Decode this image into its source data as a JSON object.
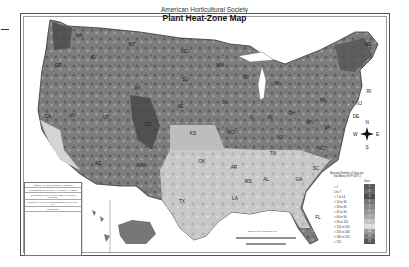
{
  "header": {
    "org": "American Horticultural Society",
    "title": "Plant Heat-Zone Map"
  },
  "legend": {
    "title": "Average Number of Days per Year Above 86°F (30°C)",
    "zone_header": "Zone",
    "rows": [
      {
        "range": "< 1",
        "zone": "1",
        "color": "#5a5a5a"
      },
      {
        "range": "1 to 7",
        "zone": "2",
        "color": "#6a6a6a"
      },
      {
        "range": "> 7 to 14",
        "zone": "3",
        "color": "#4e4e4e"
      },
      {
        "range": "> 14 to 30",
        "zone": "4",
        "color": "#767676"
      },
      {
        "range": "> 30 to 45",
        "zone": "5",
        "color": "#868686"
      },
      {
        "range": "> 45 to 60",
        "zone": "6",
        "color": "#969696"
      },
      {
        "range": "> 60 to 90",
        "zone": "7",
        "color": "#a8a8a8"
      },
      {
        "range": "> 90 to 120",
        "zone": "8",
        "color": "#c4c4c4"
      },
      {
        "range": "> 120 to 150",
        "zone": "9",
        "color": "#dcdcdc"
      },
      {
        "range": "> 150 to 180",
        "zone": "10",
        "color": "#9a9a9a"
      },
      {
        "range": "> 180 to 210",
        "zone": "11",
        "color": "#7a7a7a"
      },
      {
        "range": "> 210",
        "zone": "12",
        "color": "#555555"
      }
    ]
  },
  "compass": {
    "n": "N",
    "s": "S",
    "e": "E",
    "w": "W"
  },
  "states": [
    {
      "abbr": "WA",
      "x": 79,
      "y": 37
    },
    {
      "abbr": "OR",
      "x": 58,
      "y": 67
    },
    {
      "abbr": "ID",
      "x": 93,
      "y": 59
    },
    {
      "abbr": "MT",
      "x": 132,
      "y": 46
    },
    {
      "abbr": "ND",
      "x": 185,
      "y": 53
    },
    {
      "abbr": "MN",
      "x": 220,
      "y": 67
    },
    {
      "abbr": "WI",
      "x": 246,
      "y": 79
    },
    {
      "abbr": "MI",
      "x": 277,
      "y": 85
    },
    {
      "abbr": "ME",
      "x": 368,
      "y": 46
    },
    {
      "abbr": "SD",
      "x": 185,
      "y": 81
    },
    {
      "abbr": "WY",
      "x": 138,
      "y": 90
    },
    {
      "abbr": "NV",
      "x": 72,
      "y": 117
    },
    {
      "abbr": "UT",
      "x": 106,
      "y": 119
    },
    {
      "abbr": "CO",
      "x": 148,
      "y": 126
    },
    {
      "abbr": "NE",
      "x": 180,
      "y": 108
    },
    {
      "abbr": "IA",
      "x": 225,
      "y": 104
    },
    {
      "abbr": "IL",
      "x": 252,
      "y": 119
    },
    {
      "abbr": "IN",
      "x": 270,
      "y": 119
    },
    {
      "abbr": "OH",
      "x": 292,
      "y": 115
    },
    {
      "abbr": "PA",
      "x": 323,
      "y": 102
    },
    {
      "abbr": "CA",
      "x": 48,
      "y": 118
    },
    {
      "abbr": "KS",
      "x": 193,
      "y": 135
    },
    {
      "abbr": "MO",
      "x": 231,
      "y": 134
    },
    {
      "abbr": "KY",
      "x": 281,
      "y": 139
    },
    {
      "abbr": "WV",
      "x": 310,
      "y": 124
    },
    {
      "abbr": "VA",
      "x": 327,
      "y": 129
    },
    {
      "abbr": "NC",
      "x": 321,
      "y": 150
    },
    {
      "abbr": "TN",
      "x": 273,
      "y": 155
    },
    {
      "abbr": "AZ",
      "x": 98,
      "y": 165
    },
    {
      "abbr": "NM",
      "x": 141,
      "y": 167
    },
    {
      "abbr": "OK",
      "x": 202,
      "y": 163
    },
    {
      "abbr": "AR",
      "x": 234,
      "y": 169
    },
    {
      "abbr": "SC",
      "x": 316,
      "y": 170
    },
    {
      "abbr": "MS",
      "x": 248,
      "y": 183
    },
    {
      "abbr": "AL",
      "x": 266,
      "y": 181
    },
    {
      "abbr": "GA",
      "x": 299,
      "y": 181
    },
    {
      "abbr": "TX",
      "x": 182,
      "y": 203
    },
    {
      "abbr": "LA",
      "x": 235,
      "y": 200
    },
    {
      "abbr": "FL",
      "x": 318,
      "y": 219
    },
    {
      "abbr": "RI",
      "x": 369,
      "y": 93
    },
    {
      "abbr": "NJ",
      "x": 359,
      "y": 105
    },
    {
      "abbr": "DE",
      "x": 356,
      "y": 118
    }
  ],
  "infobox": {
    "lines": [
      "AMERICAN HORTICULTURAL SOCIETY",
      "7931 East Boulevard Drive, Alexandria, VA 22308",
      "Coordinated by Dr. H. Marc Cathey, President Emeritus",
      "Compiled by Meteorological Evaluation Services Co., Inc.",
      "Cartography"
    ]
  },
  "insets": {
    "hawaii_label": "Scale for Hawaii",
    "alaska_label": "Scale for Alaska"
  },
  "scale": {
    "label": "Scale for the mainland U.S."
  }
}
